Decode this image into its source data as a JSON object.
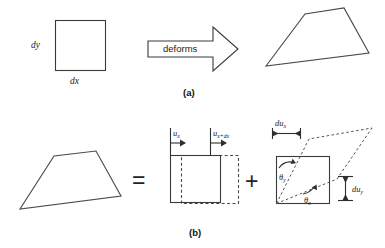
{
  "figure": {
    "background": "#ffffff",
    "line_color": "#3a3a3a",
    "text_color": "#1a1a1a"
  },
  "panel_a": {
    "caption": "(a)",
    "undeformed_square": {
      "label_height": "dy",
      "label_width": "dx",
      "x": 55,
      "y": 20,
      "w": 50,
      "h": 50
    },
    "arrow": {
      "label": "deforms",
      "direction": "right"
    },
    "deformed_shape": {
      "name": "deformed-quadrilateral",
      "points": "266,66 305,14 344,8 369,53"
    }
  },
  "panel_b": {
    "caption": "(b)",
    "deformed_shape": {
      "name": "deformed-quadrilateral",
      "points": "20,209 54,156 96,151 121,196"
    },
    "equals_symbol": "=",
    "plus_symbol": "+",
    "translation_term": {
      "name": "translation-diagram",
      "label_left": "u",
      "label_left_sub": "x",
      "label_right": "u",
      "label_right_sub": "x+dx",
      "solid_square": {
        "x": 170,
        "y": 155,
        "w": 50,
        "h": 47
      },
      "dashed_square": {
        "x": 181,
        "y": 155,
        "w": 57,
        "h": 48
      }
    },
    "strain_term": {
      "name": "strain-diagram",
      "solid_square": {
        "x": 276,
        "y": 156,
        "w": 53,
        "h": 47
      },
      "angle_y": "θ",
      "angle_y_sub": "y",
      "angle_x": "θ",
      "angle_x_sub": "x",
      "dim_top": "du",
      "dim_top_sub": "x",
      "dim_right": "du",
      "dim_right_sub": "y"
    }
  }
}
